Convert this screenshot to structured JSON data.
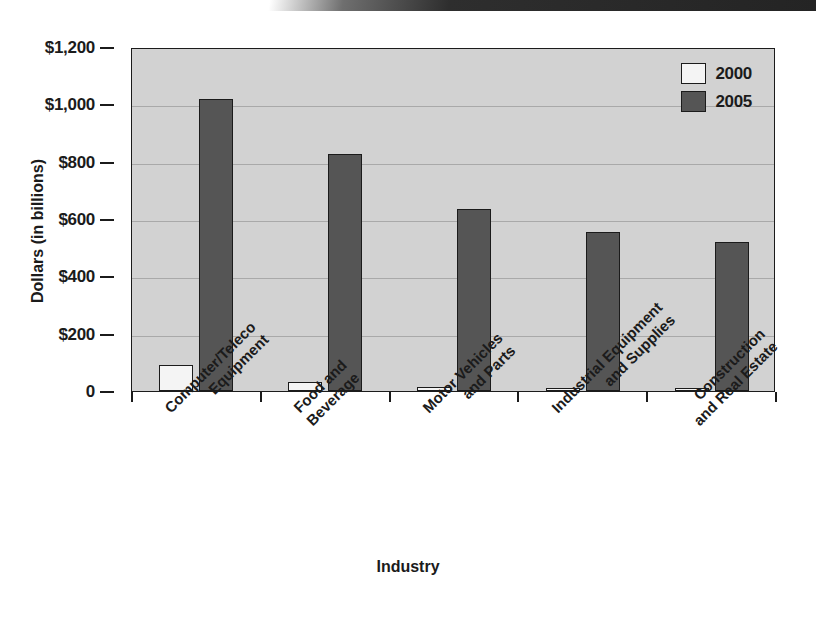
{
  "chart_data": {
    "type": "bar",
    "title": "",
    "xlabel": "Industry",
    "ylabel": "Dollars (in billions)",
    "categories": [
      "Computer/Teleco Equipment",
      "Food and Beverage",
      "Motor Vehicles and Parts",
      "Industrial Equipment and Supplies",
      "Construction and Real Estate"
    ],
    "category_lines": [
      [
        "Computer/Teleco",
        "Equipment"
      ],
      [
        "Food and",
        "Beverage"
      ],
      [
        "Motor Vehicles",
        "and Parts"
      ],
      [
        "Industrial Equipment",
        "and Supplies"
      ],
      [
        "Construction",
        "and Real Estate"
      ]
    ],
    "series": [
      {
        "name": "2000",
        "color": "#f4f4f4",
        "values": [
          90,
          33,
          13,
          12,
          8
        ]
      },
      {
        "name": "2005",
        "color": "#555555",
        "values": [
          1020,
          828,
          636,
          556,
          520
        ]
      }
    ],
    "ylim": [
      0,
      1200
    ],
    "yticks": [
      0,
      200,
      400,
      600,
      800,
      1000,
      1200
    ],
    "ytick_labels": [
      "0",
      "$200",
      "$400",
      "$600",
      "$800",
      "$1,000",
      "$1,200"
    ],
    "grid": true,
    "legend_position": "top-right",
    "plot_background": "#d2d2d2",
    "axis_color": "#1b1b1b"
  },
  "legend": {
    "items": [
      {
        "label": "2000"
      },
      {
        "label": "2005"
      }
    ]
  }
}
